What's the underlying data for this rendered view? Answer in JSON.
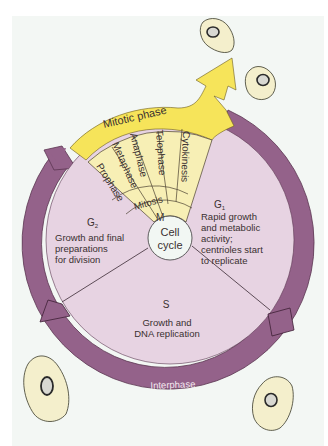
{
  "colors": {
    "background": "#f3f7f4",
    "ring": "#94628a",
    "ring_stroke": "#5a3550",
    "sector_fill": "#e7d3e2",
    "mitotic_yellow": "#f6e45a",
    "phase_fill": "#f7efb5",
    "cell_fill": "#f4efcc",
    "center_fill": "#f2f7f3"
  },
  "center": {
    "line1": "Cell",
    "line2": "cycle"
  },
  "mitotic_arrow": {
    "label": "Mitotic phase"
  },
  "interphase": {
    "label": "Interphase"
  },
  "mitosis_phases": [
    "Prophase",
    "Metaphase",
    "Anaphase",
    "Telophase"
  ],
  "cytokinesis": "Cytokinesis",
  "mitosis_label": "Mitosis",
  "m_label": "M",
  "sectors": {
    "g1": {
      "name": "G",
      "sub": "1",
      "lines": [
        "Rapid growth",
        "and metabolic",
        "activity;",
        "centrioles start",
        "to replicate"
      ]
    },
    "g2": {
      "name": "G",
      "sub": "2",
      "lines": [
        "Growth and final",
        "preparations",
        "for division"
      ]
    },
    "s": {
      "name": "S",
      "lines": [
        "Growth and",
        "DNA replication"
      ]
    }
  },
  "cells": [
    {
      "name": "cell-top-right-1"
    },
    {
      "name": "cell-top-right-2"
    },
    {
      "name": "cell-bottom-left"
    },
    {
      "name": "cell-bottom-right"
    }
  ]
}
